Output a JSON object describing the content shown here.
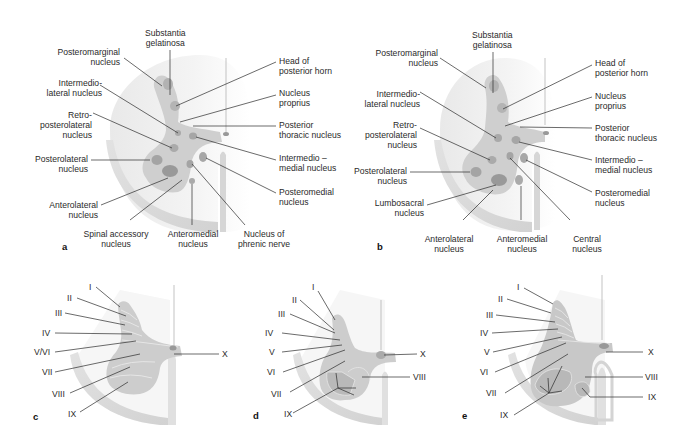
{
  "figure": {
    "panels": {
      "a": {
        "letter": "a",
        "labels": {
          "substantia_gelatinosa": [
            "Substantia",
            "gelatinosa"
          ],
          "posteromarginal": [
            "Posteromarginal",
            "nucleus"
          ],
          "intermediolateral": [
            "Intermedio-",
            "lateral nucleus"
          ],
          "retroposterolateral": [
            "Retro-",
            "posterolateral",
            "nucleus"
          ],
          "posterolateral": [
            "Posterolateral",
            "nucleus"
          ],
          "anterolateral": [
            "Anterolateral",
            "nucleus"
          ],
          "spinal_accessory": [
            "Spinal accessory",
            "nucleus"
          ],
          "anteromedial": [
            "Anteromedial",
            "nucleus"
          ],
          "phrenic": [
            "Nucleus of",
            "phrenic nerve"
          ],
          "head_posterior_horn": [
            "Head of",
            "posterior horn"
          ],
          "nucleus_proprius": [
            "Nucleus",
            "proprius"
          ],
          "posterior_thoracic": [
            "Posterior",
            "thoracic nucleus"
          ],
          "intermediomedial": [
            "Intermedio –",
            "medial nucleus"
          ],
          "posteromedial": [
            "Posteromedial",
            "nucleus"
          ]
        }
      },
      "b": {
        "letter": "b",
        "labels": {
          "substantia_gelatinosa": [
            "Substantia",
            "gelatinosa"
          ],
          "posteromarginal": [
            "Posteromarginal",
            "nucleus"
          ],
          "intermediolateral": [
            "Intermedio-",
            "lateral nucleus"
          ],
          "retroposterolateral": [
            "Retro-",
            "posterolateral",
            "nucleus"
          ],
          "posterolateral": [
            "Posterolateral",
            "nucleus"
          ],
          "lumbosacral": [
            "Lumbosacral",
            "nucleus"
          ],
          "anterolateral": [
            "Anterolateral",
            "nucleus"
          ],
          "anteromedial": [
            "Anteromedial",
            "nucleus"
          ],
          "central": [
            "Central",
            "nucleus"
          ],
          "head_posterior_horn": [
            "Head of",
            "posterior horn"
          ],
          "nucleus_proprius": [
            "Nucleus",
            "proprius"
          ],
          "posterior_thoracic": [
            "Posterior",
            "thoracic nucleus"
          ],
          "intermediomedial": [
            "Intermedio –",
            "medial nucleus"
          ],
          "posteromedial": [
            "Posteromedial",
            "nucleus"
          ]
        }
      },
      "c": {
        "letter": "c",
        "laminae_left": [
          "I",
          "II",
          "III",
          "IV",
          "V/VI",
          "VII",
          "VIII",
          "IX"
        ],
        "laminae_right": [
          "X"
        ]
      },
      "d": {
        "letter": "d",
        "laminae_left": [
          "I",
          "II",
          "III",
          "IV",
          "V",
          "VI",
          "VII",
          "IX"
        ],
        "laminae_right": [
          "X",
          "VIII"
        ]
      },
      "e": {
        "letter": "e",
        "laminae_left": [
          "I",
          "II",
          "III",
          "IV",
          "V",
          "VI",
          "VII",
          "IX"
        ],
        "laminae_right": [
          "X",
          "VIII",
          "IX"
        ]
      }
    },
    "colors": {
      "gray_matter": "#c9c9c9",
      "nucleus": "#a9a9a9",
      "white_matter": "#f1f1f1",
      "lamina_dark": "#b9b9b9",
      "leader_line": "#2b2b2b"
    }
  }
}
